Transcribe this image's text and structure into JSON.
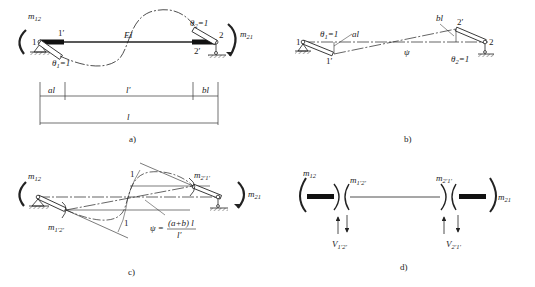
{
  "panels": {
    "a": {
      "caption": "a)",
      "labels": {
        "m12": "m",
        "m12_sub": "12",
        "m21": "m",
        "m21_sub": "21",
        "node1": "1",
        "node1p": "1′",
        "node2": "2",
        "node2p": "2′",
        "EI": "EI",
        "theta1": "θ",
        "theta1_sub": "1",
        "theta1_val": "=1",
        "theta2": "θ",
        "theta2_sub": "2",
        "theta2_val": "=1"
      },
      "dimensions": {
        "al": "al",
        "lp": "l′",
        "bl": "bl",
        "l": "l"
      }
    },
    "b": {
      "caption": "b)",
      "labels": {
        "node1": "1",
        "node1p": "1′",
        "node2": "2",
        "node2p": "2′",
        "theta1": "θ",
        "theta1_sub": "1",
        "theta1_val": "=1",
        "theta2": "θ",
        "theta2_sub": "2",
        "theta2_val": "=1",
        "al": "al",
        "bl": "bl",
        "psi": "ψ"
      }
    },
    "c": {
      "caption": "c)",
      "labels": {
        "m12": "m",
        "m12_sub": "12",
        "m21": "m",
        "m21_sub": "21",
        "m1p2p": "m",
        "m1p2p_sub": "1′2′",
        "m2p1p": "m",
        "m2p1p_sub": "2′1′",
        "one_top": "1",
        "one_bottom": "1",
        "psi_lhs": "ψ =",
        "psi_num": "(a+b) l",
        "psi_den": "l′"
      }
    },
    "d": {
      "caption": "d)",
      "labels": {
        "m12": "m",
        "m12_sub": "12",
        "m21": "m",
        "m21_sub": "21",
        "m1p2p": "m",
        "m1p2p_sub": "1′2′",
        "m2p1p": "m",
        "m2p1p_sub": "2′1′",
        "V1p2p": "V",
        "V1p2p_sub": "1′2′",
        "V2p1p": "V",
        "V2p1p_sub": "2′1′"
      }
    }
  }
}
